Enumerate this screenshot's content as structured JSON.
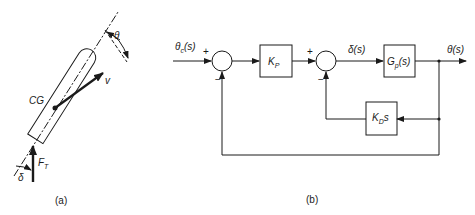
{
  "figure_a": {
    "caption": "(a)",
    "labels": {
      "cg": "CG",
      "velocity": "v",
      "theta": "θ",
      "thrust": "F",
      "thrust_sub": "T",
      "delta": "δ"
    }
  },
  "figure_b": {
    "caption": "(b)",
    "input": {
      "main": "θ",
      "sub": "c",
      "arg": "(s)"
    },
    "output": "θ(s)",
    "intermediate": "δ(s)",
    "blocks": {
      "kp": {
        "main": "K",
        "sub": "P"
      },
      "gp": {
        "main": "G",
        "sub": "p",
        "arg": "(s)"
      },
      "kd": {
        "main": "K",
        "sub": "D",
        "arg": "s"
      }
    },
    "signs": {
      "sum1_plus": "+",
      "sum1_minus": "−",
      "sum2_plus": "+",
      "sum2_minus": "−"
    }
  }
}
